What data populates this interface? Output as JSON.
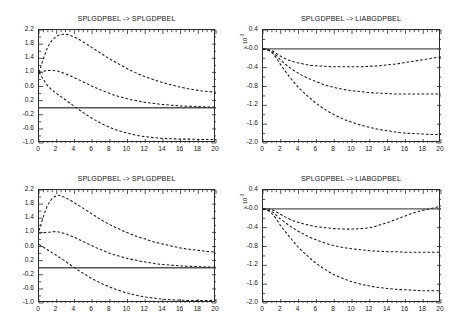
{
  "figure": {
    "width": 464,
    "height": 321,
    "background": "#ffffff",
    "line_color": "#1a1a1a",
    "zero_line_color": "#555555",
    "layout": "2x2 grid of impulse-response panels"
  },
  "chart_data": [
    {
      "type": "line",
      "panel": "top-left",
      "title": "SPLGDPBEL -> SPLGDPBEL",
      "xlabel": "",
      "ylabel": "",
      "xlim": [
        0,
        20
      ],
      "ylim": [
        -1.0,
        2.2
      ],
      "xticks": [
        0,
        2,
        4,
        6,
        8,
        10,
        12,
        14,
        16,
        18,
        20
      ],
      "xticklabels": [
        "0",
        "2",
        "4",
        "6",
        "8",
        "10",
        "12",
        "14",
        "16",
        "18",
        "20"
      ],
      "yticks": [
        -1.0,
        -0.6,
        -0.2,
        0.2,
        0.6,
        1.0,
        1.4,
        1.8,
        2.2
      ],
      "yticklabels": [
        "-1.0",
        "-0.6",
        "-0.2",
        "0.2",
        "0.6",
        "1.0",
        "1.4",
        "1.8",
        "2.2"
      ],
      "grid": false,
      "legend": "none",
      "exponent_label": "",
      "zero_line": 0,
      "x": [
        0,
        1,
        2,
        3,
        4,
        5,
        6,
        7,
        8,
        9,
        10,
        11,
        12,
        13,
        14,
        15,
        16,
        17,
        18,
        19,
        20
      ],
      "series": [
        {
          "name": "upper band",
          "style": "dashed",
          "values": [
            1.0,
            1.72,
            2.02,
            2.08,
            2.0,
            1.86,
            1.7,
            1.54,
            1.38,
            1.24,
            1.1,
            0.98,
            0.88,
            0.79,
            0.71,
            0.64,
            0.58,
            0.53,
            0.49,
            0.46,
            0.44
          ]
        },
        {
          "name": "median",
          "style": "dashed",
          "values": [
            1.0,
            1.05,
            1.04,
            0.96,
            0.85,
            0.73,
            0.61,
            0.5,
            0.4,
            0.32,
            0.25,
            0.2,
            0.15,
            0.12,
            0.09,
            0.07,
            0.05,
            0.04,
            0.03,
            0.02,
            0.02
          ]
        },
        {
          "name": "lower band",
          "style": "dashed",
          "values": [
            1.0,
            0.62,
            0.4,
            0.22,
            0.04,
            -0.14,
            -0.3,
            -0.44,
            -0.56,
            -0.65,
            -0.72,
            -0.78,
            -0.82,
            -0.85,
            -0.87,
            -0.88,
            -0.89,
            -0.89,
            -0.9,
            -0.9,
            -0.9
          ]
        }
      ]
    },
    {
      "type": "line",
      "panel": "top-right",
      "title": "SPLGDPBEL -> LIABGDPBEL",
      "xlabel": "",
      "ylabel": "",
      "xlim": [
        0,
        20
      ],
      "ylim": [
        -2.0,
        0.4
      ],
      "xticks": [
        0,
        2,
        4,
        6,
        8,
        10,
        12,
        14,
        16,
        18,
        20
      ],
      "xticklabels": [
        "0",
        "2",
        "4",
        "6",
        "8",
        "10",
        "12",
        "14",
        "16",
        "18",
        "20"
      ],
      "yticks": [
        -2.0,
        -1.6,
        -1.2,
        -0.8,
        -0.4,
        -0.0,
        0.4
      ],
      "yticklabels": [
        "-2.0",
        "-1.6",
        "-1.2",
        "-0.8",
        "-0.4",
        "-0.0",
        "0.4"
      ],
      "grid": false,
      "legend": "none",
      "exponent_label": "x 10",
      "exponent_value": "-3",
      "zero_line": 0,
      "x": [
        0,
        1,
        2,
        3,
        4,
        5,
        6,
        7,
        8,
        9,
        10,
        11,
        12,
        13,
        14,
        15,
        16,
        17,
        18,
        19,
        20
      ],
      "series": [
        {
          "name": "upper band",
          "style": "dashed",
          "values": [
            0.0,
            -0.04,
            -0.16,
            -0.25,
            -0.3,
            -0.34,
            -0.36,
            -0.37,
            -0.38,
            -0.38,
            -0.38,
            -0.38,
            -0.37,
            -0.36,
            -0.34,
            -0.32,
            -0.29,
            -0.26,
            -0.23,
            -0.2,
            -0.17
          ]
        },
        {
          "name": "median",
          "style": "dashed",
          "values": [
            0.0,
            -0.06,
            -0.24,
            -0.4,
            -0.52,
            -0.62,
            -0.7,
            -0.77,
            -0.82,
            -0.86,
            -0.89,
            -0.91,
            -0.93,
            -0.94,
            -0.95,
            -0.96,
            -0.96,
            -0.96,
            -0.96,
            -0.96,
            -0.96
          ]
        },
        {
          "name": "lower band",
          "style": "dashed",
          "values": [
            0.0,
            -0.08,
            -0.34,
            -0.6,
            -0.82,
            -1.0,
            -1.16,
            -1.29,
            -1.4,
            -1.49,
            -1.56,
            -1.62,
            -1.67,
            -1.71,
            -1.74,
            -1.77,
            -1.79,
            -1.8,
            -1.81,
            -1.82,
            -1.82
          ]
        }
      ]
    },
    {
      "type": "line",
      "panel": "bottom-left",
      "title": "SPLGDPBEL -> SPLGDPBEL",
      "xlabel": "",
      "ylabel": "",
      "xlim": [
        0,
        20
      ],
      "ylim": [
        -1.0,
        2.2
      ],
      "xticks": [
        0,
        2,
        4,
        6,
        8,
        10,
        12,
        14,
        16,
        18,
        20
      ],
      "xticklabels": [
        "0",
        "2",
        "4",
        "6",
        "8",
        "10",
        "12",
        "14",
        "16",
        "18",
        "20"
      ],
      "yticks": [
        -1.0,
        -0.6,
        -0.2,
        0.2,
        0.6,
        1.0,
        1.4,
        1.8,
        2.2
      ],
      "yticklabels": [
        "-1.0",
        "-0.6",
        "-0.2",
        "0.2",
        "0.6",
        "1.0",
        "1.4",
        "1.8",
        "2.2"
      ],
      "grid": false,
      "legend": "none",
      "exponent_label": "",
      "zero_line": 0,
      "x": [
        0,
        1,
        2,
        3,
        4,
        5,
        6,
        7,
        8,
        9,
        10,
        11,
        12,
        13,
        14,
        15,
        16,
        17,
        18,
        19,
        20
      ],
      "series": [
        {
          "name": "upper band",
          "style": "dashed",
          "values": [
            1.05,
            1.78,
            2.04,
            1.98,
            1.84,
            1.68,
            1.52,
            1.36,
            1.22,
            1.1,
            0.99,
            0.89,
            0.81,
            0.73,
            0.67,
            0.61,
            0.56,
            0.52,
            0.49,
            0.46,
            0.44
          ]
        },
        {
          "name": "median",
          "style": "dashed",
          "values": [
            0.98,
            1.0,
            1.02,
            0.96,
            0.86,
            0.74,
            0.62,
            0.51,
            0.41,
            0.33,
            0.26,
            0.21,
            0.16,
            0.12,
            0.09,
            0.07,
            0.05,
            0.04,
            0.03,
            0.02,
            0.02
          ]
        },
        {
          "name": "lower band",
          "style": "dashed",
          "values": [
            0.66,
            0.5,
            0.34,
            0.18,
            0.0,
            -0.16,
            -0.31,
            -0.44,
            -0.55,
            -0.64,
            -0.72,
            -0.78,
            -0.83,
            -0.86,
            -0.89,
            -0.91,
            -0.92,
            -0.93,
            -0.93,
            -0.93,
            -0.92
          ]
        }
      ]
    },
    {
      "type": "line",
      "panel": "bottom-right",
      "title": "SPLGDPBEL -> LIABGDPBEL",
      "xlabel": "",
      "ylabel": "",
      "xlim": [
        0,
        20
      ],
      "ylim": [
        -2.0,
        0.4
      ],
      "xticks": [
        0,
        2,
        4,
        6,
        8,
        10,
        12,
        14,
        16,
        18,
        20
      ],
      "xticklabels": [
        "0",
        "2",
        "4",
        "6",
        "8",
        "10",
        "12",
        "14",
        "16",
        "18",
        "20"
      ],
      "yticks": [
        -2.0,
        -1.6,
        -1.2,
        -0.8,
        -0.4,
        -0.0,
        0.4
      ],
      "yticklabels": [
        "-2.0",
        "-1.6",
        "-1.2",
        "-0.8",
        "-0.4",
        "-0.0",
        "0.4"
      ],
      "grid": false,
      "legend": "none",
      "exponent_label": "x 10",
      "exponent_value": "-3",
      "zero_line": 0,
      "x": [
        0,
        1,
        2,
        3,
        4,
        5,
        6,
        7,
        8,
        9,
        10,
        11,
        12,
        13,
        14,
        15,
        16,
        17,
        18,
        19,
        20
      ],
      "series": [
        {
          "name": "upper band",
          "style": "dashed",
          "values": [
            0.0,
            -0.02,
            -0.12,
            -0.22,
            -0.29,
            -0.34,
            -0.38,
            -0.4,
            -0.42,
            -0.43,
            -0.43,
            -0.42,
            -0.4,
            -0.35,
            -0.29,
            -0.22,
            -0.15,
            -0.08,
            -0.03,
            0.01,
            0.06
          ]
        },
        {
          "name": "median",
          "style": "dashed",
          "values": [
            0.0,
            -0.06,
            -0.22,
            -0.36,
            -0.48,
            -0.58,
            -0.66,
            -0.73,
            -0.78,
            -0.82,
            -0.85,
            -0.87,
            -0.89,
            -0.9,
            -0.91,
            -0.91,
            -0.92,
            -0.92,
            -0.92,
            -0.92,
            -0.92
          ]
        },
        {
          "name": "lower band",
          "style": "dashed",
          "values": [
            0.0,
            -0.1,
            -0.36,
            -0.6,
            -0.82,
            -1.0,
            -1.16,
            -1.29,
            -1.4,
            -1.48,
            -1.55,
            -1.6,
            -1.64,
            -1.67,
            -1.69,
            -1.71,
            -1.72,
            -1.73,
            -1.74,
            -1.74,
            -1.74
          ]
        }
      ]
    }
  ]
}
